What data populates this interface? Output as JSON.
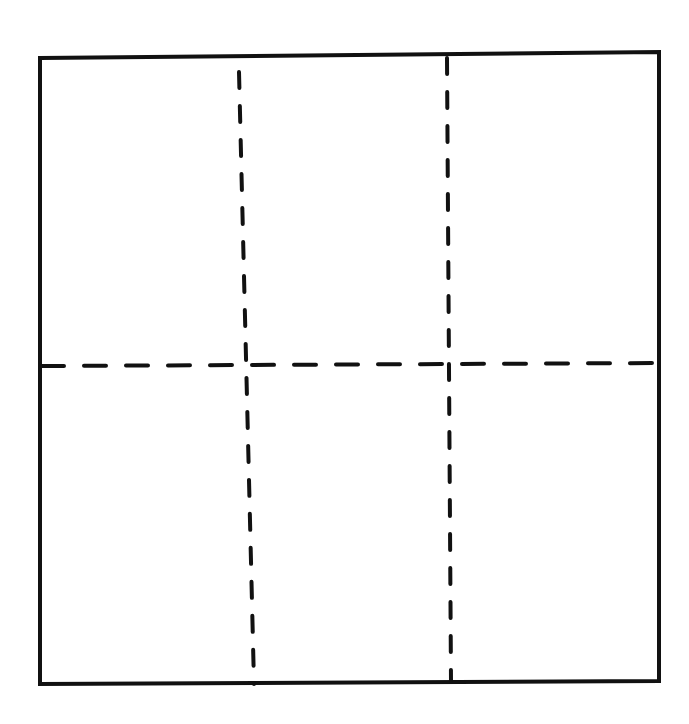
{
  "diagram": {
    "title": "",
    "stroke_color": "#111111",
    "background_color": "#ffffff",
    "outer_square": {
      "points": [
        [
          40,
          58
        ],
        [
          659,
          52
        ],
        [
          659,
          681
        ],
        [
          40,
          684
        ]
      ],
      "stroke_width": 4
    },
    "dashed_lines": [
      {
        "id": "vertical-left",
        "x1": 239,
        "y1": 72,
        "x2": 254,
        "y2": 684,
        "stroke_width": 4,
        "dash": "16 18"
      },
      {
        "id": "vertical-right",
        "x1": 447,
        "y1": 58,
        "x2": 451,
        "y2": 681,
        "stroke_width": 4,
        "dash": "16 18"
      },
      {
        "id": "horizontal-mid",
        "x1": 42,
        "y1": 366,
        "x2": 657,
        "y2": 363,
        "stroke_width": 4,
        "dash": "22 20"
      }
    ],
    "grid": {
      "columns": 3,
      "rows": 2,
      "cells": [
        "top-left",
        "top-middle",
        "top-right",
        "bottom-left",
        "bottom-middle",
        "bottom-right"
      ]
    }
  }
}
